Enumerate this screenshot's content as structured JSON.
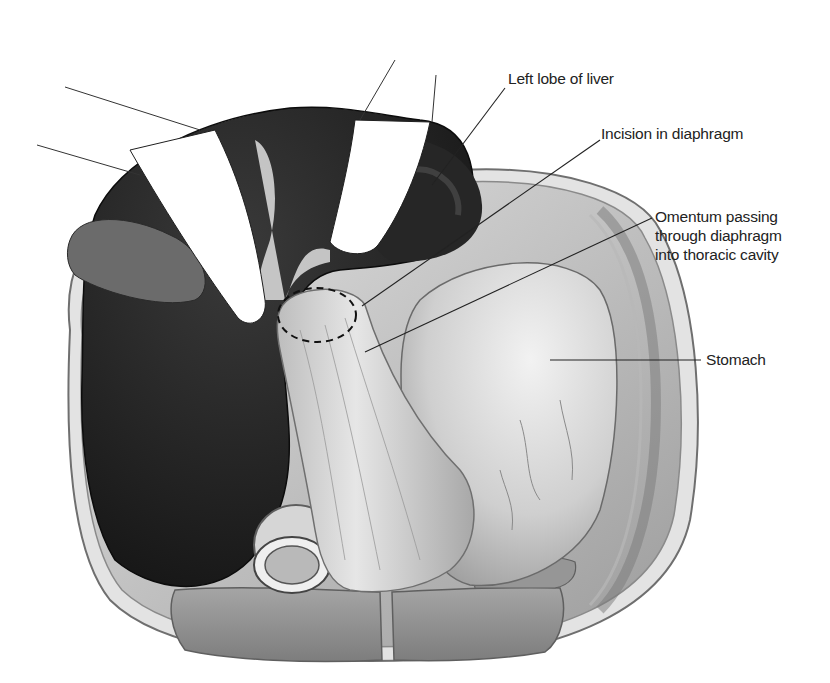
{
  "figure": {
    "type": "anatomical-illustration",
    "labels": [
      {
        "id": "left-lobe-liver",
        "text": "Left lobe of liver"
      },
      {
        "id": "incision-diaphragm",
        "text": "Incision in diaphragm"
      },
      {
        "id": "omentum",
        "text": "Omentum passing\nthrough diaphragm\ninto thoracic cavity"
      },
      {
        "id": "stomach",
        "text": "Stomach"
      }
    ],
    "colors": {
      "liver": "#1f1f1f",
      "tissue_light": "#dcdcdc",
      "tissue_mid": "#b5b5b5",
      "muscle": "#8f8f8f",
      "retractor": "#ffffff",
      "leader_line": "#222222"
    }
  }
}
